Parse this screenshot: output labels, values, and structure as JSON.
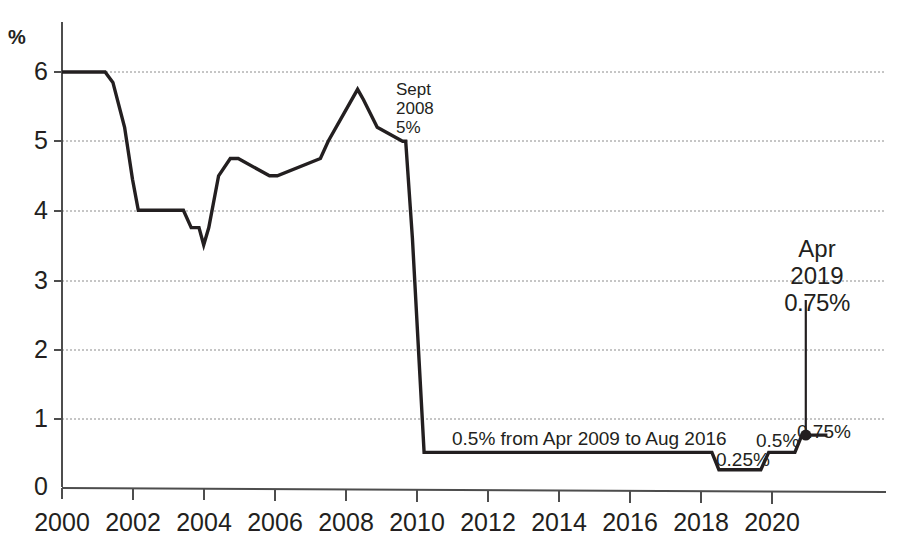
{
  "chart_data": {
    "type": "line",
    "title": "",
    "subtitle": "",
    "xlabel": "",
    "ylabel": "%",
    "ylim": [
      0,
      6.6
    ],
    "xlim": [
      2000,
      2020.5
    ],
    "grid": true,
    "legend": "none",
    "y_ticks": [
      "0",
      "1",
      "2",
      "3",
      "4",
      "5",
      "6"
    ],
    "y_tick_values": [
      0,
      1,
      2,
      3,
      4,
      5,
      6
    ],
    "x_ticks": [
      "2000",
      "2002",
      "2004",
      "2006",
      "2008",
      "2010",
      "2012",
      "2014",
      "2016",
      "2018",
      "2020"
    ],
    "x_tick_values": [
      2000,
      2002,
      2004,
      2006,
      2008,
      2010,
      2012,
      2014,
      2016,
      2018,
      2020
    ],
    "series": [
      {
        "name": "Bank Rate",
        "x": [
          2000.0,
          2001.1,
          2001.3,
          2001.6,
          2001.8,
          2001.95,
          2003.1,
          2003.3,
          2003.5,
          2003.62,
          2003.75,
          2004.0,
          2004.3,
          2004.5,
          2005.3,
          2005.5,
          2006.6,
          2006.8,
          2007.55,
          2007.7,
          2008.05,
          2008.7,
          2008.78,
          2008.95,
          2009.25,
          2016.6,
          2016.78,
          2017.85,
          2018.05,
          2018.72,
          2018.9,
          2019.55
        ],
        "y": [
          6.0,
          6.0,
          5.85,
          5.2,
          4.45,
          4.0,
          4.0,
          3.75,
          3.75,
          3.5,
          3.75,
          4.5,
          4.75,
          4.75,
          4.5,
          4.5,
          4.75,
          5.0,
          5.75,
          5.6,
          5.2,
          5.0,
          5.0,
          3.6,
          0.5,
          0.5,
          0.25,
          0.25,
          0.5,
          0.5,
          0.75,
          0.75
        ]
      }
    ],
    "marker_point": {
      "x": 2019.0,
      "y": 0.75
    },
    "annotations": [
      {
        "id": "sept-2008",
        "lines": [
          "Sept",
          "2008",
          "5%"
        ],
        "x": 2008.8,
        "y": 5.0
      },
      {
        "id": "apr-2019",
        "lines": [
          "Apr",
          "2019",
          "0.75%"
        ],
        "x": 2019.0,
        "y": 0.75
      },
      {
        "id": "half-pct-span",
        "text": "0.5% from Apr 2009 to Aug 2016",
        "x": 2011.0,
        "y": 0.72
      },
      {
        "id": "step-025",
        "text": "0.25%",
        "x": 2016.9,
        "y": 0.35
      },
      {
        "id": "step-05",
        "text": "0.5%",
        "x": 2018.1,
        "y": 0.65
      },
      {
        "id": "step-075",
        "text": "0.75%",
        "x": 2019.2,
        "y": 0.92
      }
    ],
    "colors": {
      "line": "#231f20",
      "grid": "#8c8c8c",
      "axis": "#4d4d4d",
      "text": "#231f20",
      "background": "#ffffff"
    }
  }
}
